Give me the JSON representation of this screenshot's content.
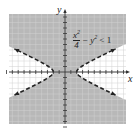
{
  "chart_data": {
    "type": "area",
    "title": "",
    "inequality": "x^2/4 - y^2 < 1",
    "annotation": {
      "numerator": "x",
      "numerator_exp": "2",
      "denominator": "4",
      "rest": "− y",
      "rest_exp": "2",
      "relation": "< 1"
    },
    "xlabel": "x",
    "ylabel": "y",
    "xlim": [
      -10,
      10
    ],
    "ylim": [
      -10,
      10
    ],
    "grid": true,
    "boundary": {
      "curve": "hyperbola",
      "equation": "x^2/4 - y^2 = 1",
      "vertices": [
        [
          -2,
          0
        ],
        [
          2,
          0
        ]
      ],
      "asymptotes": [
        "y = x/2",
        "y = -x/2"
      ],
      "style": "dashed"
    },
    "shaded_region": "between the branches (region containing the origin)",
    "colors": {
      "shade": "#b8b8b8",
      "grid": "#d8d8d8",
      "axis": "#333333",
      "boundary": "#222222"
    }
  }
}
